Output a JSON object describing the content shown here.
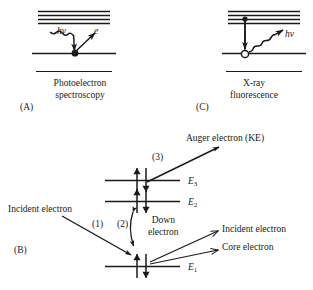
{
  "figure": {
    "background_color": "#ffffff",
    "ink_color": "#1a1a1a",
    "width": 313,
    "height": 290
  },
  "panels": {
    "a": {
      "letter": "(A)",
      "caption_line1": "Photoelectron",
      "caption_line2": "spectroscopy",
      "incoming_label": "hv",
      "outgoing_label": "e",
      "incoming_icon": "wavy-photon-arrow-icon",
      "outgoing_icon": "straight-electron-arrow-icon",
      "site_icon": "filled-electron-dot-icon",
      "valence_band_line_count": 4
    },
    "b": {
      "letter": "(B)",
      "levels": [
        {
          "id": "E3",
          "label": "E",
          "subscript": "3",
          "occupancy_icon": "spin-pair-up-down-icon"
        },
        {
          "id": "E2",
          "label": "E",
          "subscript": "2",
          "occupancy_icon": "spin-pair-up-down-icon"
        },
        {
          "id": "E1",
          "label": "E",
          "subscript": "1",
          "occupancy_icon": "spin-pair-up-down-icon"
        }
      ],
      "steps": [
        {
          "number": "(1)",
          "name": "incident-electron-in"
        },
        {
          "number": "(2)",
          "name": "down-electron-relaxation"
        },
        {
          "number": "(3)",
          "name": "auger-electron-out"
        }
      ],
      "labels": {
        "incident_in": "Incident electron",
        "down_electron_line1": "Down",
        "down_electron_line2": "electron",
        "auger_out": "Auger electron (KE)",
        "incident_out": "Incident electron",
        "core_out": "Core electron"
      }
    },
    "c": {
      "letter": "(C)",
      "caption_line1": "X-ray",
      "caption_line2": "fluorescence",
      "emission_label": "hv",
      "emission_icon": "wavy-photon-arrow-icon",
      "transition_icon": "down-transition-arrow-icon",
      "upper_site_icon": "filled-electron-dot-icon",
      "core_hole_icon": "open-circle-hole-icon",
      "valence_band_line_count": 4
    }
  }
}
